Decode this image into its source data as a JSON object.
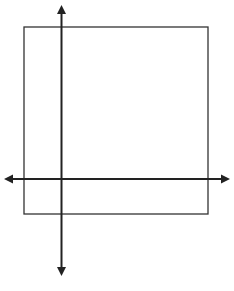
{
  "diagram": {
    "type": "coordinate-axes-with-square",
    "stroke_color": "#222222",
    "rect_stroke_color": "#333333",
    "background": "#ffffff",
    "rectangle": {
      "x": 24,
      "y": 27,
      "width": 184,
      "height": 187
    },
    "vertical_axis": {
      "x": 61.5,
      "y1": 5,
      "y2": 276,
      "arrows": [
        "up",
        "down"
      ]
    },
    "horizontal_axis": {
      "y": 179,
      "x1": 4,
      "x2": 230,
      "arrows": [
        "left",
        "right"
      ]
    }
  },
  "cut_off_text": {
    "top": "",
    "bottom": ""
  }
}
